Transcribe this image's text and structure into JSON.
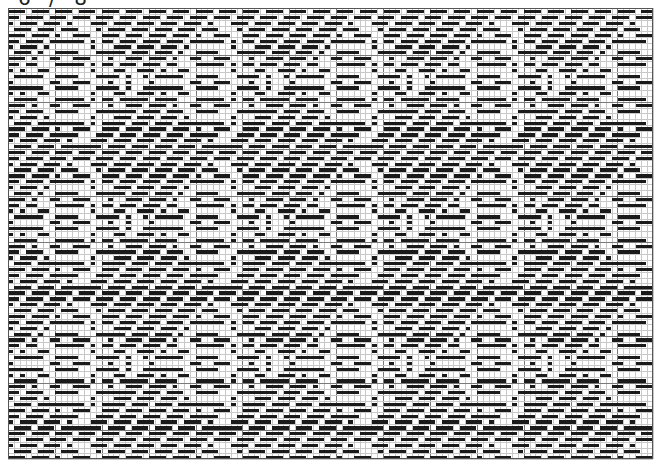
{
  "header": {
    "clipped_label": "6 / 8"
  },
  "draft": {
    "origin": [
      8,
      8
    ],
    "cols": 110,
    "rows": 77,
    "cell_px": 5.86,
    "major_every": 8,
    "repeat_cols": 24,
    "repeat_rows": 24,
    "fill_color": "#1a1a1a",
    "grid_color": "#c8c8c8",
    "major_grid_color": "#7a7a7a",
    "background": "#ffffff"
  }
}
